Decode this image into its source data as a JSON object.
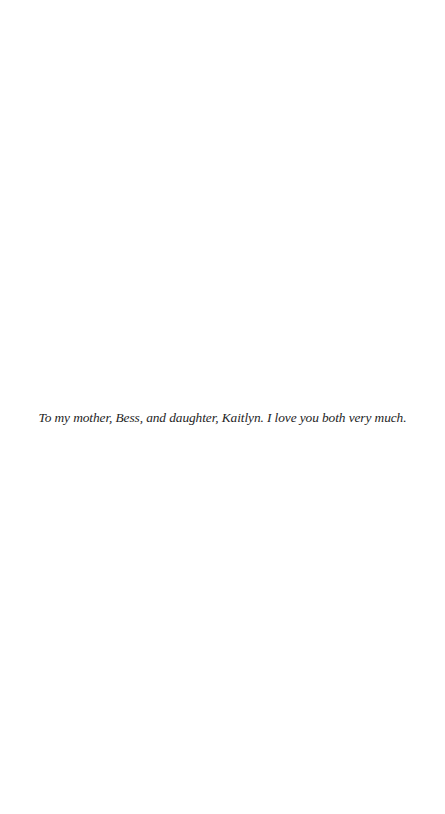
{
  "page": {
    "dedication": "To my mother, Bess, and daughter, Kaitlyn. I love you both very much."
  }
}
